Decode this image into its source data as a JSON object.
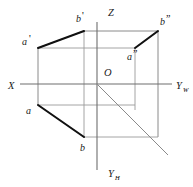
{
  "figure": {
    "background_color": "#ffffff",
    "axis_color": "#6e6e6e",
    "box_color": "#8a8a8a",
    "projection_color": "#111111"
  },
  "axes": [
    {
      "name": "x-axis",
      "label": "X",
      "label_x": 8,
      "label_y": 89
    },
    {
      "name": "z-axis",
      "label": "Z",
      "label_x": 108,
      "label_y": 16
    },
    {
      "name": "yw-axis",
      "label": "Y",
      "subscript": "W",
      "label_x": 176,
      "label_y": 89
    },
    {
      "name": "yh-axis",
      "label": "Y",
      "subscript": "H",
      "label_x": 108,
      "label_y": 177
    }
  ],
  "origin": {
    "label": "O",
    "label_x": 104,
    "label_y": 76,
    "x": 97,
    "y": 84
  },
  "vertices": [
    {
      "name": "a-prime",
      "label": "a",
      "prime": "'",
      "label_x": 22,
      "label_y": 45,
      "x": 38,
      "y": 48
    },
    {
      "name": "b-prime",
      "label": "b",
      "prime": "'",
      "label_x": 76,
      "label_y": 22,
      "x": 84,
      "y": 31
    },
    {
      "name": "b-double-prime",
      "label": "b",
      "prime": "”",
      "label_x": 160,
      "label_y": 25,
      "x": 158,
      "y": 31
    },
    {
      "name": "a-double-prime",
      "label": "a",
      "prime": "”",
      "label_x": 127,
      "label_y": 60,
      "x": 135,
      "y": 48
    },
    {
      "name": "a-horizontal",
      "label": "a",
      "prime": "",
      "label_x": 26,
      "label_y": 114,
      "x": 38,
      "y": 105
    },
    {
      "name": "b-horizontal",
      "label": "b",
      "prime": "",
      "label_x": 80,
      "label_y": 151,
      "x": 84,
      "y": 137
    }
  ],
  "projection_segments": [
    {
      "name": "frontal-projection-ab",
      "x1": 38,
      "y1": 48,
      "x2": 84,
      "y2": 31
    },
    {
      "name": "profile-projection-ab",
      "x1": 135,
      "y1": 48,
      "x2": 158,
      "y2": 31
    },
    {
      "name": "horizontal-projection-ab",
      "x1": 38,
      "y1": 105,
      "x2": 84,
      "y2": 137
    }
  ],
  "bisector": {
    "name": "forty-five-degree-bisector",
    "x1": 97,
    "y1": 84,
    "x2": 168,
    "y2": 155
  }
}
